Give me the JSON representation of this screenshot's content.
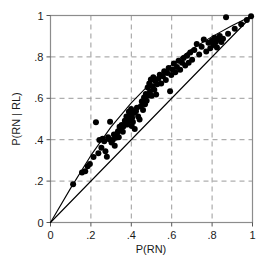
{
  "chart_data": {
    "type": "scatter",
    "title": "",
    "xlabel": "P(RN)",
    "ylabel": "P(RN | RL)",
    "xlim": [
      0,
      1
    ],
    "ylim": [
      0,
      1
    ],
    "xticks": [
      0,
      0.2,
      0.4,
      0.6,
      0.8,
      1
    ],
    "yticks": [
      0,
      0.2,
      0.4,
      0.6,
      0.8,
      1
    ],
    "xtick_labels": [
      "0",
      ".2",
      ".4",
      ".6",
      ".8",
      "1"
    ],
    "ytick_labels": [
      "0",
      ".2",
      ".4",
      ".6",
      ".8",
      "1"
    ],
    "grid": true,
    "grid_style": "dashed",
    "grid_color": "#9a9a9a",
    "frame_color": "#8c8c8c",
    "marker_color": "#000000",
    "marker_size": 4.2,
    "legend": null,
    "series": [
      {
        "name": "observations",
        "marker": "filled-circle",
        "x": [
          0.112,
          0.156,
          0.172,
          0.184,
          0.195,
          0.213,
          0.225,
          0.237,
          0.242,
          0.252,
          0.258,
          0.266,
          0.272,
          0.279,
          0.285,
          0.291,
          0.295,
          0.302,
          0.308,
          0.314,
          0.318,
          0.323,
          0.329,
          0.334,
          0.338,
          0.342,
          0.348,
          0.352,
          0.358,
          0.362,
          0.368,
          0.372,
          0.376,
          0.381,
          0.385,
          0.388,
          0.392,
          0.396,
          0.399,
          0.402,
          0.404,
          0.408,
          0.412,
          0.417,
          0.423,
          0.428,
          0.434,
          0.441,
          0.447,
          0.452,
          0.458,
          0.463,
          0.468,
          0.472,
          0.476,
          0.481,
          0.486,
          0.489,
          0.493,
          0.497,
          0.501,
          0.505,
          0.509,
          0.514,
          0.518,
          0.523,
          0.528,
          0.534,
          0.541,
          0.548,
          0.556,
          0.563,
          0.571,
          0.578,
          0.585,
          0.592,
          0.598,
          0.604,
          0.611,
          0.618,
          0.626,
          0.634,
          0.642,
          0.651,
          0.659,
          0.667,
          0.676,
          0.684,
          0.692,
          0.701,
          0.712,
          0.724,
          0.736,
          0.748,
          0.759,
          0.771,
          0.782,
          0.791,
          0.799,
          0.806,
          0.812,
          0.818,
          0.824,
          0.831,
          0.838,
          0.846,
          0.854,
          0.869,
          0.879,
          0.912,
          0.944,
          0.972,
          0.993
        ],
        "y": [
          0.185,
          0.242,
          0.248,
          0.272,
          0.283,
          0.316,
          0.484,
          0.334,
          0.398,
          0.361,
          0.404,
          0.392,
          0.344,
          0.318,
          0.412,
          0.402,
          0.487,
          0.386,
          0.398,
          0.425,
          0.371,
          0.409,
          0.428,
          0.441,
          0.412,
          0.462,
          0.448,
          0.471,
          0.438,
          0.465,
          0.492,
          0.481,
          0.512,
          0.474,
          0.508,
          0.535,
          0.492,
          0.521,
          0.548,
          0.466,
          0.506,
          0.486,
          0.529,
          0.452,
          0.538,
          0.554,
          0.512,
          0.498,
          0.562,
          0.584,
          0.543,
          0.604,
          0.571,
          0.621,
          0.588,
          0.652,
          0.614,
          0.672,
          0.634,
          0.691,
          0.612,
          0.658,
          0.702,
          0.641,
          0.684,
          0.618,
          0.668,
          0.695,
          0.714,
          0.672,
          0.706,
          0.731,
          0.688,
          0.722,
          0.746,
          0.634,
          0.712,
          0.739,
          0.768,
          0.726,
          0.751,
          0.782,
          0.738,
          0.772,
          0.795,
          0.758,
          0.806,
          0.772,
          0.821,
          0.786,
          0.833,
          0.862,
          0.812,
          0.849,
          0.884,
          0.826,
          0.868,
          0.842,
          0.878,
          0.858,
          0.892,
          0.871,
          0.846,
          0.884,
          0.901,
          0.872,
          0.888,
          0.991,
          0.912,
          0.936,
          0.958,
          0.978,
          0.996
        ]
      }
    ],
    "lines": [
      {
        "name": "identity-line",
        "style": "solid",
        "color": "#000000",
        "x": [
          0,
          1
        ],
        "y": [
          0,
          1
        ],
        "description": "diagonal reference line y = x"
      },
      {
        "name": "fit-line",
        "style": "solid",
        "color": "#000000",
        "x": [
          0,
          0.1,
          0.2,
          0.3,
          0.4,
          0.5,
          0.6,
          0.7,
          0.8,
          0.9,
          1
        ],
        "y": [
          0,
          0.166,
          0.324,
          0.462,
          0.578,
          0.678,
          0.762,
          0.838,
          0.898,
          0.952,
          1
        ],
        "description": "fitted curve bowing above the identity line"
      }
    ]
  }
}
